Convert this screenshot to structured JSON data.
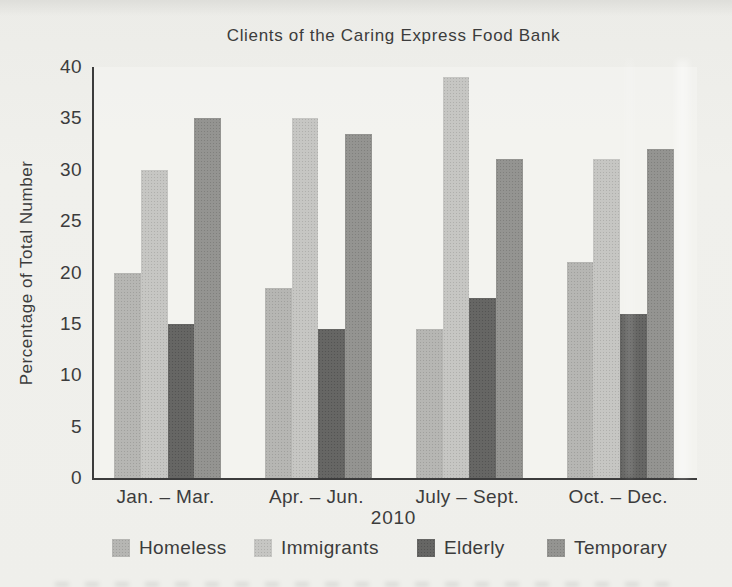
{
  "title": "Clients of the Caring Express Food Bank",
  "y_axis": {
    "label": "Percentage of Total Number",
    "ticks": [
      "40",
      "35",
      "30",
      "25",
      "20",
      "15",
      "10",
      "5",
      "0"
    ]
  },
  "x_axis": {
    "categories": [
      "Jan. – Mar.",
      "Apr. – Jun.",
      "July – Sept.",
      "Oct. – Dec."
    ],
    "year": "2010"
  },
  "legend": [
    {
      "label": "Homeless",
      "color": "#b2b2af"
    },
    {
      "label": "Immigrants",
      "color": "#c3c3c0"
    },
    {
      "label": "Elderly",
      "color": "#5e5e5c"
    },
    {
      "label": "Temporary",
      "color": "#8e8e8b"
    }
  ],
  "chart_data": {
    "type": "bar",
    "title": "Clients of the Caring Express Food Bank",
    "categories": [
      "Jan. – Mar.",
      "Apr. – Jun.",
      "July – Sept.",
      "Oct. – Dec."
    ],
    "series": [
      {
        "name": "Homeless",
        "color": "#b2b2af",
        "values": [
          20,
          18.5,
          14.5,
          21
        ]
      },
      {
        "name": "Immigrants",
        "color": "#c3c3c0",
        "values": [
          30,
          35,
          39,
          31
        ]
      },
      {
        "name": "Elderly",
        "color": "#5e5e5c",
        "values": [
          15,
          14.5,
          17.5,
          16
        ]
      },
      {
        "name": "Temporary",
        "color": "#8e8e8b",
        "values": [
          35,
          33.5,
          31,
          32
        ]
      }
    ],
    "xlabel": "2010",
    "ylabel": "Percentage of Total Number",
    "ylim": [
      0,
      40
    ],
    "ytick_step": 5,
    "grid": false,
    "legend_position": "bottom"
  },
  "colors": {
    "paper": "#eeeeea",
    "axis": "#3c3c3c",
    "text": "#3f3f3f"
  }
}
